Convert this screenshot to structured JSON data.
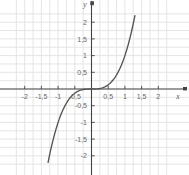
{
  "chart_data": {
    "type": "line",
    "title": "",
    "xlabel": "x",
    "ylabel": "y",
    "function": "y = x^3",
    "grid": true,
    "grid_step": 0.25,
    "legend": "none",
    "xlim": [
      -2.3,
      2.35
    ],
    "ylim": [
      -2.25,
      2.4
    ],
    "x_ticks": [
      -2,
      -1.5,
      -1,
      -0.5,
      0.5,
      1,
      1.5,
      2
    ],
    "x_tick_labels": [
      "-2",
      "-1,5",
      "-1",
      "-0,5",
      "0,5",
      "1",
      "1,5",
      "2"
    ],
    "y_ticks": [
      -2,
      -1.5,
      -1,
      -0.5,
      0.5,
      1,
      1.5,
      2
    ],
    "y_tick_labels": [
      "-2",
      "-1,5",
      "-1",
      "-0,5",
      "0,5",
      "1",
      "1,5",
      "2"
    ],
    "x": [
      -1.3,
      -1.25,
      -1.2,
      -1.15,
      -1.1,
      -1.05,
      -1.0,
      -0.95,
      -0.9,
      -0.85,
      -0.8,
      -0.75,
      -0.7,
      -0.65,
      -0.6,
      -0.55,
      -0.5,
      -0.45,
      -0.4,
      -0.35,
      -0.3,
      -0.25,
      -0.2,
      -0.15,
      -0.1,
      -0.05,
      0.0,
      0.05,
      0.1,
      0.15,
      0.2,
      0.25,
      0.3,
      0.35,
      0.4,
      0.45,
      0.5,
      0.55,
      0.6,
      0.65,
      0.7,
      0.75,
      0.8,
      0.85,
      0.9,
      0.95,
      1.0,
      1.05,
      1.1,
      1.15,
      1.2,
      1.25,
      1.3
    ],
    "values": [
      -2.197,
      -1.953,
      -1.728,
      -1.521,
      -1.331,
      -1.158,
      -1.0,
      -0.857,
      -0.729,
      -0.614,
      -0.512,
      -0.422,
      -0.343,
      -0.275,
      -0.216,
      -0.166,
      -0.125,
      -0.091,
      -0.064,
      -0.043,
      -0.027,
      -0.016,
      -0.008,
      -0.003,
      -0.001,
      0.0,
      0.0,
      0.0,
      0.001,
      0.003,
      0.008,
      0.016,
      0.027,
      0.043,
      0.064,
      0.091,
      0.125,
      0.166,
      0.216,
      0.275,
      0.343,
      0.422,
      0.512,
      0.614,
      0.729,
      0.857,
      1.0,
      1.158,
      1.331,
      1.521,
      1.728,
      1.953,
      2.197
    ],
    "curve_color": "#555555",
    "grid_color": "#e2e2e2",
    "axis_color": "#444444"
  },
  "axes": {
    "x_axis_name": "x",
    "y_axis_name": "y"
  }
}
